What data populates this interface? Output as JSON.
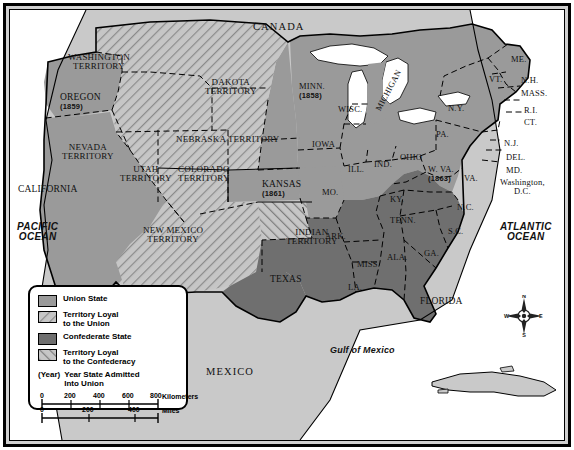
{
  "map": {
    "title_context": "The United States during the Civil War",
    "countries": [
      {
        "name": "CANADA",
        "x": 253,
        "y": 22,
        "cls": "country"
      },
      {
        "name": "MEXICO",
        "x": 206,
        "y": 367,
        "cls": "country"
      }
    ],
    "oceans": [
      {
        "name": "PACIFIC\nOCEAN",
        "x": 17,
        "y": 222,
        "cls": "ocean"
      },
      {
        "name": "ATLANTIC\nOCEAN",
        "x": 500,
        "y": 222,
        "cls": "ocean"
      },
      {
        "name": "Gulf of Mexico",
        "x": 330,
        "y": 346,
        "cls": "gulf"
      }
    ],
    "regions": [
      {
        "name": "WASHINGTON\nTERRITORY",
        "x": 68,
        "y": 53,
        "cls": "terr",
        "status": "territory-union"
      },
      {
        "name": "OREGON",
        "x": 60,
        "y": 93,
        "cls": "state big",
        "status": "union",
        "year": "(1859)"
      },
      {
        "name": "NEVADA\nTERRITORY",
        "x": 62,
        "y": 143,
        "cls": "terr",
        "status": "territory-union"
      },
      {
        "name": "CALIFORNIA",
        "x": 18,
        "y": 185,
        "cls": "state big",
        "status": "union"
      },
      {
        "name": "UTAH\nTERRITORY",
        "x": 120,
        "y": 165,
        "cls": "terr",
        "status": "territory-union"
      },
      {
        "name": "COLORADO\nTERRITORY",
        "x": 178,
        "y": 165,
        "cls": "terr",
        "status": "territory-union"
      },
      {
        "name": "DAKOTA\nTERRITORY",
        "x": 205,
        "y": 78,
        "cls": "terr",
        "status": "territory-union"
      },
      {
        "name": "NEBRASKA TERRITORY",
        "x": 176,
        "y": 135,
        "cls": "terr",
        "status": "territory-union"
      },
      {
        "name": "NEW MEXICO\nTERRITORY",
        "x": 143,
        "y": 226,
        "cls": "terr",
        "status": "territory-union"
      },
      {
        "name": "INDIAN\nTERRITORY",
        "x": 286,
        "y": 228,
        "cls": "terr",
        "status": "territory-confederacy"
      },
      {
        "name": "KANSAS",
        "x": 262,
        "y": 180,
        "cls": "state big",
        "status": "union",
        "year": "(1861)"
      },
      {
        "name": "MINN.",
        "x": 299,
        "y": 82,
        "cls": "state",
        "status": "union",
        "year": "(1858)"
      },
      {
        "name": "WISC.",
        "x": 338,
        "y": 105,
        "cls": "state",
        "status": "union"
      },
      {
        "name": "MICHIGAN",
        "x": 366,
        "y": 86,
        "cls": "state",
        "status": "union",
        "rotate": -62
      },
      {
        "name": "IOWA",
        "x": 312,
        "y": 140,
        "cls": "state",
        "status": "union"
      },
      {
        "name": "ILL.",
        "x": 348,
        "y": 165,
        "cls": "state",
        "status": "union"
      },
      {
        "name": "IND.",
        "x": 374,
        "y": 160,
        "cls": "state",
        "status": "union"
      },
      {
        "name": "OHIO",
        "x": 400,
        "y": 153,
        "cls": "state",
        "status": "union"
      },
      {
        "name": "MO.",
        "x": 322,
        "y": 188,
        "cls": "state",
        "status": "union"
      },
      {
        "name": "KY.",
        "x": 390,
        "y": 195,
        "cls": "state",
        "status": "union"
      },
      {
        "name": "PA.",
        "x": 436,
        "y": 130,
        "cls": "state",
        "status": "union"
      },
      {
        "name": "N.Y.",
        "x": 448,
        "y": 104,
        "cls": "state",
        "status": "union"
      },
      {
        "name": "ME.",
        "x": 511,
        "y": 55,
        "cls": "state",
        "status": "union"
      },
      {
        "name": "VT.",
        "x": 489,
        "y": 75,
        "cls": "state",
        "status": "union"
      },
      {
        "name": "N.H.",
        "x": 521,
        "y": 76,
        "cls": "state",
        "status": "union"
      },
      {
        "name": "MASS.",
        "x": 521,
        "y": 89,
        "cls": "state",
        "status": "union"
      },
      {
        "name": "R.I.",
        "x": 524,
        "y": 106,
        "cls": "state",
        "status": "union"
      },
      {
        "name": "CT.",
        "x": 524,
        "y": 118,
        "cls": "state",
        "status": "union"
      },
      {
        "name": "N.J.",
        "x": 504,
        "y": 139,
        "cls": "state",
        "status": "union"
      },
      {
        "name": "DEL.",
        "x": 506,
        "y": 153,
        "cls": "state",
        "status": "union"
      },
      {
        "name": "MD.",
        "x": 506,
        "y": 166,
        "cls": "state",
        "status": "union"
      },
      {
        "name": "Washington,\nD.C.",
        "x": 500,
        "y": 178,
        "cls": "state",
        "status": "union"
      },
      {
        "name": "W. VA.",
        "x": 428,
        "y": 165,
        "cls": "state",
        "status": "union",
        "year": "(1863)"
      },
      {
        "name": "VA.",
        "x": 464,
        "y": 174,
        "cls": "state",
        "status": "confederate"
      },
      {
        "name": "N.C.",
        "x": 457,
        "y": 203,
        "cls": "state",
        "status": "confederate"
      },
      {
        "name": "S.C.",
        "x": 448,
        "y": 227,
        "cls": "state",
        "status": "confederate"
      },
      {
        "name": "TENN.",
        "x": 390,
        "y": 216,
        "cls": "state",
        "status": "confederate"
      },
      {
        "name": "ARK.",
        "x": 325,
        "y": 232,
        "cls": "state",
        "status": "confederate"
      },
      {
        "name": "MISS.",
        "x": 357,
        "y": 260,
        "cls": "state",
        "status": "confederate"
      },
      {
        "name": "ALA.",
        "x": 387,
        "y": 253,
        "cls": "state",
        "status": "confederate"
      },
      {
        "name": "GA.",
        "x": 424,
        "y": 249,
        "cls": "state",
        "status": "confederate"
      },
      {
        "name": "LA.",
        "x": 348,
        "y": 283,
        "cls": "state",
        "status": "confederate"
      },
      {
        "name": "TEXAS",
        "x": 270,
        "y": 275,
        "cls": "state big",
        "status": "confederate"
      },
      {
        "name": "FLORIDA",
        "x": 420,
        "y": 297,
        "cls": "state big",
        "status": "confederate"
      }
    ]
  },
  "legend": {
    "items": [
      {
        "swatch": "union-solid",
        "label": "Union State"
      },
      {
        "swatch": "union-hatch",
        "label": "Territory Loyal\nto the Union"
      },
      {
        "swatch": "confederate-solid",
        "label": "Confederate State"
      },
      {
        "swatch": "confederate-hatch",
        "label": "Territory Loyal\nto the Confederacy"
      }
    ],
    "year_key": "(Year)",
    "year_label": "Year State Admitted\nInto Union",
    "scale": {
      "km_ticks": [
        "0",
        "200",
        "400",
        "600",
        "800"
      ],
      "km_unit": "Kilometers",
      "mi_ticks": [
        "0",
        "200",
        "400"
      ],
      "mi_unit": "Miles"
    }
  },
  "compass": {
    "n": "N",
    "e": "E",
    "s": "S",
    "w": "W"
  },
  "colors": {
    "union": "#9a9a9a",
    "confederate": "#6f6f6f",
    "territory_fill": "#c6c6c6",
    "land_other": "#c9c9c9",
    "water": "#ffffff",
    "border": "#000000"
  }
}
